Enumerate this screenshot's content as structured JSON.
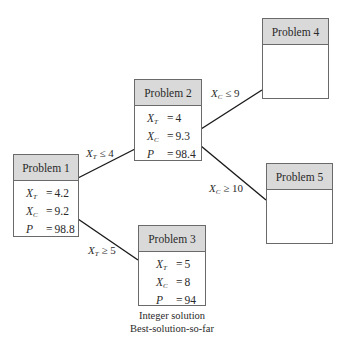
{
  "diagram": {
    "type": "branch-and-bound tree",
    "colors": {
      "header_fill": "#d9d9d9",
      "border": "#6a6a6a",
      "edge": "#1a1a1a",
      "background": "#ffffff"
    },
    "nodes": [
      {
        "id": "p1",
        "title": "Problem 1",
        "vars": [
          {
            "name": "X",
            "sub": "T",
            "op": "=",
            "value": "4.2"
          },
          {
            "name": "X",
            "sub": "C",
            "op": "=",
            "value": "9.2"
          },
          {
            "name": "P",
            "sub": "",
            "op": "=",
            "value": "98.8"
          }
        ]
      },
      {
        "id": "p2",
        "title": "Problem 2",
        "vars": [
          {
            "name": "X",
            "sub": "T",
            "op": "=",
            "value": "4"
          },
          {
            "name": "X",
            "sub": "C",
            "op": "=",
            "value": "9.3"
          },
          {
            "name": "P",
            "sub": "",
            "op": "=",
            "value": "98.4"
          }
        ]
      },
      {
        "id": "p3",
        "title": "Problem 3",
        "vars": [
          {
            "name": "X",
            "sub": "T",
            "op": "=",
            "value": "5"
          },
          {
            "name": "X",
            "sub": "C",
            "op": "=",
            "value": "8"
          },
          {
            "name": "P",
            "sub": "",
            "op": "=",
            "value": "94"
          }
        ],
        "caption": [
          "Integer solution",
          "Best-solution-so-far"
        ]
      },
      {
        "id": "p4",
        "title": "Problem 4",
        "vars": []
      },
      {
        "id": "p5",
        "title": "Problem 5",
        "vars": []
      }
    ],
    "edges": [
      {
        "from": "p1",
        "to": "p2",
        "label": {
          "var": "X",
          "sub": "T",
          "op": "≤",
          "value": "4"
        }
      },
      {
        "from": "p1",
        "to": "p3",
        "label": {
          "var": "X",
          "sub": "T",
          "op": "≥",
          "value": "5"
        }
      },
      {
        "from": "p2",
        "to": "p4",
        "label": {
          "var": "X",
          "sub": "C",
          "op": "≤",
          "value": "9"
        }
      },
      {
        "from": "p2",
        "to": "p5",
        "label": {
          "var": "X",
          "sub": "C",
          "op": "≥",
          "value": "10"
        }
      }
    ]
  }
}
